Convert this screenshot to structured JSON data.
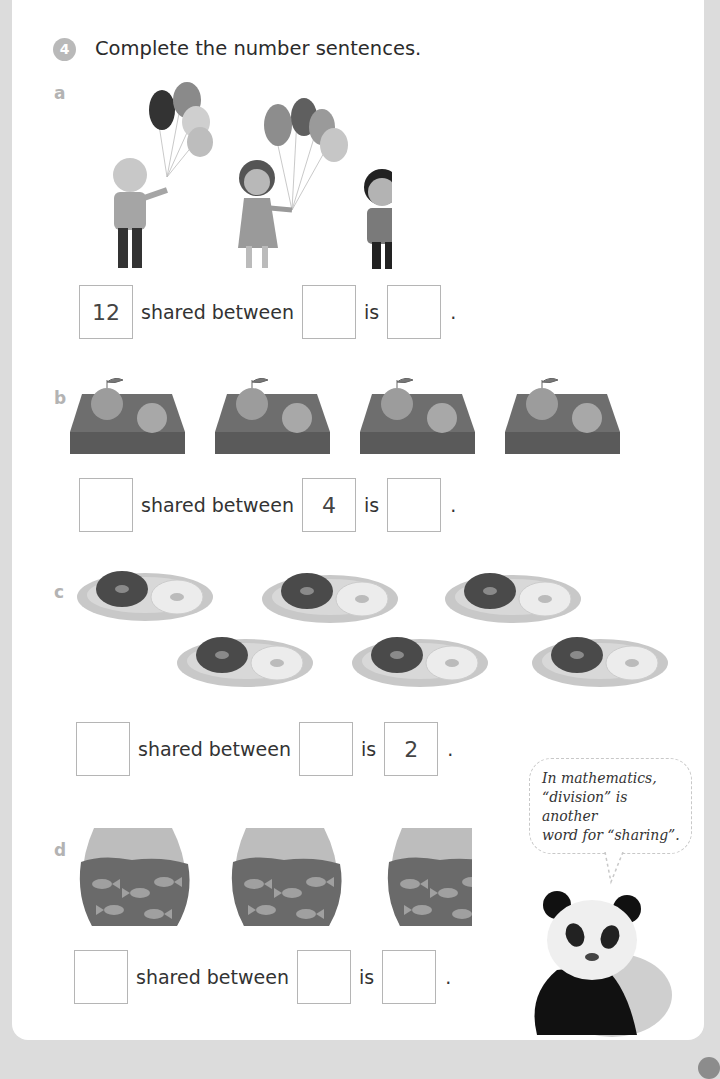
{
  "question": {
    "number": "4",
    "title": "Complete the number sentences."
  },
  "parts": [
    {
      "label": "a",
      "picture": "three children each holding balloons",
      "sentence": {
        "first": "12",
        "shared_text": "shared between",
        "second": "",
        "is_text": "is",
        "third": "",
        "end": "."
      }
    },
    {
      "label": "b",
      "picture": "four trays each holding two oranges",
      "sentence": {
        "first": "",
        "shared_text": "shared between",
        "second": "4",
        "is_text": "is",
        "third": "",
        "end": "."
      }
    },
    {
      "label": "c",
      "picture": "six plates each holding two doughnuts",
      "sentence": {
        "first": "",
        "shared_text": "shared between",
        "second": "",
        "is_text": "is",
        "third": "2",
        "end": "."
      }
    },
    {
      "label": "d",
      "picture": "three fishbowls each holding four fish",
      "sentence": {
        "first": "",
        "shared_text": "shared between",
        "second": "",
        "is_text": "is",
        "third": "",
        "end": "."
      }
    }
  ],
  "speech_bubble": {
    "line1": "In mathematics,",
    "line2": "“division” is another",
    "line3": "word for “sharing”."
  },
  "colors": {
    "frame": "#dcdcdc",
    "badge": "#b9b9b9",
    "part_label": "#b3b3b3",
    "box_border": "#b5b5b5"
  }
}
